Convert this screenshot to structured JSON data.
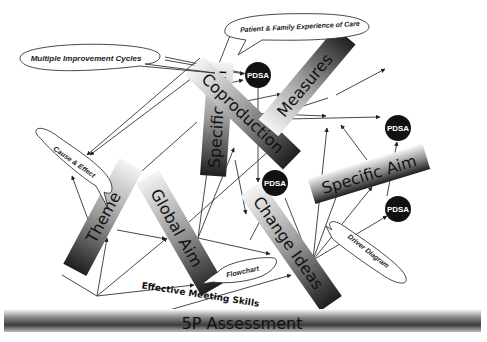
{
  "diagram": {
    "title_partial": "",
    "bars": [
      {
        "id": "specific-aim-vertical",
        "label": "Specific Aim"
      },
      {
        "id": "coproduction",
        "label": "Coproduction"
      },
      {
        "id": "measures",
        "label": "Measures"
      },
      {
        "id": "theme",
        "label": "Theme"
      },
      {
        "id": "global-aim",
        "label": "Global Aim"
      },
      {
        "id": "change-ideas",
        "label": "Change Ideas"
      },
      {
        "id": "specific-aim-right",
        "label": "Specific Aim"
      },
      {
        "id": "5p-assessment",
        "label": "5P Assessment"
      }
    ],
    "bubbles": [
      {
        "id": "multiple-improvement-cycles",
        "label": "Multiple Improvement Cycles"
      },
      {
        "id": "patient-family-experience",
        "label": "Patient & Family Experience of Care"
      },
      {
        "id": "cause-effect",
        "label": "Cause & Effect"
      },
      {
        "id": "flowchart",
        "label": "Flowchart"
      },
      {
        "id": "driver-diagram",
        "label": "Driver Diagram"
      }
    ],
    "pdsa_nodes": [
      {
        "id": "pdsa-top",
        "label": "PDSA"
      },
      {
        "id": "pdsa-middle",
        "label": "PDSA"
      },
      {
        "id": "pdsa-right-top",
        "label": "PDSA"
      },
      {
        "id": "pdsa-right-bottom",
        "label": "PDSA"
      }
    ],
    "free_text": {
      "effective_meeting_skills": "Effective Meeting Skills"
    },
    "colors": {
      "bar_dark": "#1a1a1a",
      "bar_light": "#f2f2f2",
      "pdsa_fill": "#111111",
      "line": "#333333"
    }
  }
}
